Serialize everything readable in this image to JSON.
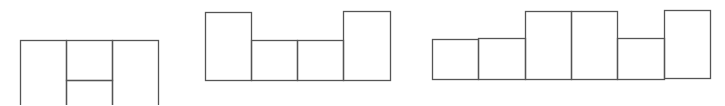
{
  "diagram": {
    "stroke_color": "#555555",
    "background": "#ffffff",
    "figures": [
      {
        "name": "net-a",
        "rects": [
          {
            "x": 20,
            "y": 40,
            "w": 46,
            "h": 70
          },
          {
            "x": 66,
            "y": 40,
            "w": 46,
            "h": 40
          },
          {
            "x": 66,
            "y": 80,
            "w": 46,
            "h": 30
          },
          {
            "x": 112,
            "y": 40,
            "w": 46,
            "h": 70
          }
        ]
      },
      {
        "name": "net-b",
        "rects": [
          {
            "x": 205,
            "y": 12,
            "w": 46,
            "h": 68
          },
          {
            "x": 251,
            "y": 40,
            "w": 46,
            "h": 40
          },
          {
            "x": 297,
            "y": 40,
            "w": 46,
            "h": 40
          },
          {
            "x": 343,
            "y": 11,
            "w": 47,
            "h": 69
          }
        ]
      },
      {
        "name": "net-c",
        "rects": [
          {
            "x": 432,
            "y": 39,
            "w": 46,
            "h": 40
          },
          {
            "x": 478,
            "y": 38,
            "w": 47,
            "h": 41
          },
          {
            "x": 525,
            "y": 11,
            "w": 46,
            "h": 68
          },
          {
            "x": 571,
            "y": 11,
            "w": 46,
            "h": 68
          },
          {
            "x": 617,
            "y": 38,
            "w": 47,
            "h": 41
          },
          {
            "x": 664,
            "y": 10,
            "w": 46,
            "h": 68
          }
        ]
      }
    ]
  }
}
